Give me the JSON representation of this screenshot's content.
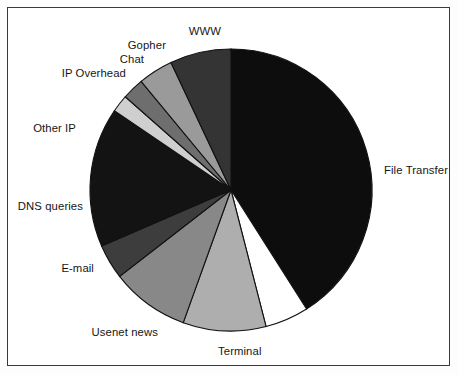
{
  "figure": {
    "title": "",
    "frame_color": "#3a3a3a",
    "background": "#ffffff"
  },
  "chart_data": {
    "type": "pie",
    "title": "",
    "xlabel": "",
    "ylabel": "",
    "legend_position": "none",
    "grid": false,
    "start_angle_deg": 90,
    "direction": "clockwise",
    "center": {
      "x": 231,
      "y": 190
    },
    "radius": 141,
    "categories": [
      "File Transfer",
      "Terminal",
      "Usenet news",
      "E-mail",
      "DNS queries",
      "Other IP",
      "IP Overhead",
      "Chat",
      "Gopher",
      "WWW"
    ],
    "values": [
      41.0,
      5.0,
      9.5,
      9.0,
      4.0,
      16.0,
      2.0,
      2.5,
      4.0,
      7.0
    ],
    "value_unit": "percent",
    "colors": [
      "#0d0d0d",
      "#ffffff",
      "#aeaeae",
      "#888888",
      "#3d3d3d",
      "#131313",
      "#cfcfcf",
      "#6e6e6e",
      "#9a9a9a",
      "#343434"
    ],
    "slice_edge_color": "#111111",
    "labels": [
      {
        "name": "File Transfer",
        "text": "File Transfer",
        "side": "right",
        "x": 384,
        "y": 164
      },
      {
        "name": "Terminal",
        "text": "Terminal",
        "side": "center",
        "x": 218,
        "y": 345
      },
      {
        "name": "Usenet news",
        "text": "Usenet news",
        "side": "left",
        "x": 158,
        "y": 326
      },
      {
        "name": "E-mail",
        "text": "E-mail",
        "side": "left",
        "x": 94,
        "y": 262
      },
      {
        "name": "DNS queries",
        "text": "DNS queries",
        "side": "left",
        "x": 83,
        "y": 200
      },
      {
        "name": "Other IP",
        "text": "Other IP",
        "side": "left",
        "x": 76,
        "y": 122
      },
      {
        "name": "IP Overhead",
        "text": "IP Overhead",
        "side": "left",
        "x": 126,
        "y": 67
      },
      {
        "name": "Chat",
        "text": "Chat",
        "side": "left",
        "x": 144,
        "y": 53
      },
      {
        "name": "Gopher",
        "text": "Gopher",
        "side": "left",
        "x": 166,
        "y": 39
      },
      {
        "name": "WWW",
        "text": "WWW",
        "side": "left",
        "x": 221,
        "y": 25
      }
    ]
  }
}
